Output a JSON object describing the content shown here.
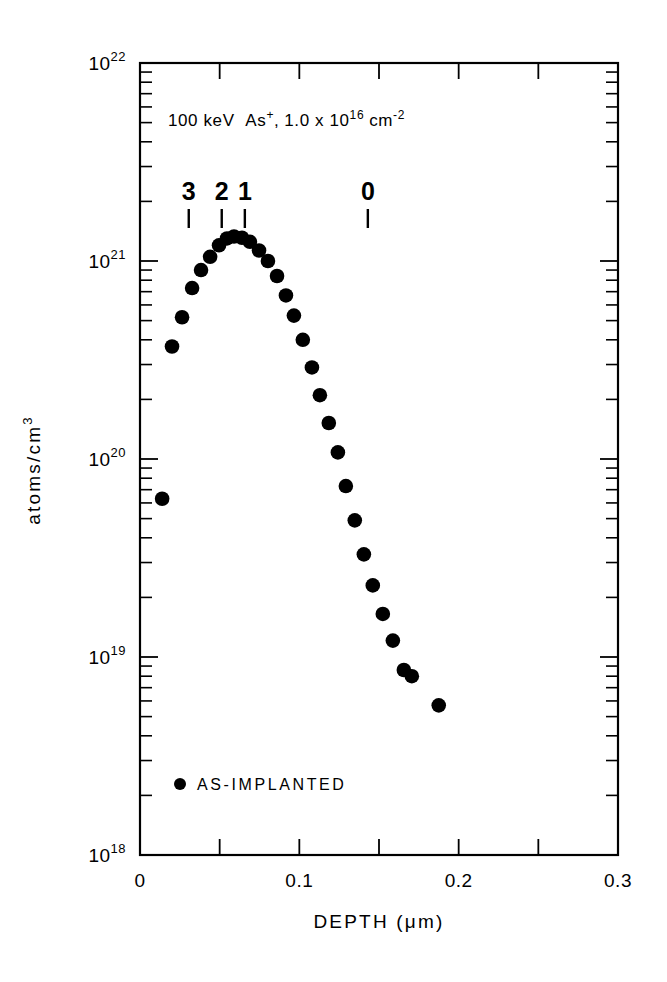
{
  "figure": {
    "background_color": "#ffffff",
    "ink_color": "#000000"
  },
  "chart_data": {
    "type": "scatter",
    "title": "",
    "annotation": "100 keV  As+, 1.0 x 1016 cm-2",
    "annotation_parts": {
      "energy": "100 keV",
      "species_base": "As",
      "species_sup": "+",
      "comma": ",",
      "dose_mantissa": "1.0 x 10",
      "dose_exponent": "16",
      "dose_unit_base": "cm",
      "dose_unit_exponent": "-2"
    },
    "xlabel": "DEPTH (μm)",
    "xlabel_parts": {
      "pre": "DEPTH (",
      "mu": "μ",
      "post": "m)"
    },
    "ylabel": "atoms/cm3",
    "ylabel_parts": {
      "base": "atoms/cm",
      "exponent": "3"
    },
    "xlim": [
      0,
      0.3
    ],
    "ylim": [
      1e+18,
      1e+22
    ],
    "yscale": "log",
    "xscale": "linear",
    "grid": false,
    "xticks": [
      0,
      0.1,
      0.2,
      0.3
    ],
    "xtick_labels": [
      "0",
      "0.1",
      "0.2",
      "0.3"
    ],
    "xminor_ticks": [
      0.05,
      0.15,
      0.25
    ],
    "yticks": [
      1e+18,
      1e+19,
      1e+20,
      1e+21,
      1e+22
    ],
    "ytick_labels": [
      {
        "base": "10",
        "exponent": "18"
      },
      {
        "base": "10",
        "exponent": "19"
      },
      {
        "base": "10",
        "exponent": "20"
      },
      {
        "base": "10",
        "exponent": "21"
      },
      {
        "base": "10",
        "exponent": "22"
      }
    ],
    "legend": {
      "position": "inside-lower-left",
      "entries": [
        {
          "label": "AS-IMPLANTED",
          "marker": "filled-circle",
          "color": "#000000"
        }
      ]
    },
    "annotation_markers": [
      {
        "label": "3",
        "x": 0.0306
      },
      {
        "label": "2",
        "x": 0.0513
      },
      {
        "label": "1",
        "x": 0.0658
      },
      {
        "label": "0",
        "x": 0.143
      }
    ],
    "series": [
      {
        "name": "AS-IMPLANTED",
        "marker": "filled-circle",
        "color": "#000000",
        "points": [
          {
            "x": 0.0139,
            "y": 6.3e+19
          },
          {
            "x": 0.0201,
            "y": 3.7e+20
          },
          {
            "x": 0.0264,
            "y": 5.2e+20
          },
          {
            "x": 0.0327,
            "y": 7.3e+20
          },
          {
            "x": 0.0383,
            "y": 9e+20
          },
          {
            "x": 0.044,
            "y": 1.05e+21
          },
          {
            "x": 0.0496,
            "y": 1.2e+21
          },
          {
            "x": 0.0546,
            "y": 1.3e+21
          },
          {
            "x": 0.059,
            "y": 1.33e+21
          },
          {
            "x": 0.064,
            "y": 1.31e+21
          },
          {
            "x": 0.069,
            "y": 1.25e+21
          },
          {
            "x": 0.0747,
            "y": 1.13e+21
          },
          {
            "x": 0.0803,
            "y": 1e+21
          },
          {
            "x": 0.086,
            "y": 8.4e+20
          },
          {
            "x": 0.0916,
            "y": 6.7e+20
          },
          {
            "x": 0.0966,
            "y": 5.3e+20
          },
          {
            "x": 0.1022,
            "y": 4e+20
          },
          {
            "x": 0.1079,
            "y": 2.9e+20
          },
          {
            "x": 0.1129,
            "y": 2.1e+20
          },
          {
            "x": 0.1185,
            "y": 1.52e+20
          },
          {
            "x": 0.1242,
            "y": 1.08e+20
          },
          {
            "x": 0.1292,
            "y": 7.3e+19
          },
          {
            "x": 0.1348,
            "y": 4.9e+19
          },
          {
            "x": 0.1405,
            "y": 3.3e+19
          },
          {
            "x": 0.1461,
            "y": 2.3e+19
          },
          {
            "x": 0.1524,
            "y": 1.65e+19
          },
          {
            "x": 0.1587,
            "y": 1.21e+19
          },
          {
            "x": 0.1656,
            "y": 8.6e+18
          },
          {
            "x": 0.1706,
            "y": 8e+18
          },
          {
            "x": 0.1875,
            "y": 5.7e+18
          }
        ]
      }
    ]
  }
}
